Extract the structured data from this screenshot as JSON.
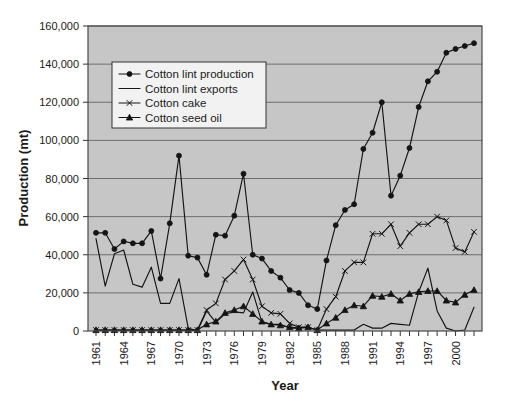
{
  "chart_data": {
    "type": "line",
    "title": "",
    "xlabel": "Year",
    "ylabel": "Production (mt)",
    "ylim": [
      0,
      160000
    ],
    "xlim": [
      1961,
      2002
    ],
    "grid": true,
    "legend_position": "upper-left-inside",
    "ytick_labels": [
      "0",
      "20,000",
      "40,000",
      "60,000",
      "80,000",
      "100,000",
      "120,000",
      "140,000",
      "160,000"
    ],
    "ytick_values": [
      0,
      20000,
      40000,
      60000,
      80000,
      100000,
      120000,
      140000,
      160000
    ],
    "xtick_labels": [
      "1961",
      "1964",
      "1967",
      "1970",
      "1973",
      "1976",
      "1979",
      "1982",
      "1985",
      "1988",
      "1991",
      "1994",
      "1997",
      "2000"
    ],
    "xtick_values": [
      1961,
      1964,
      1967,
      1970,
      1973,
      1976,
      1979,
      1982,
      1985,
      1988,
      1991,
      1994,
      1997,
      2000
    ],
    "x": [
      1961,
      1962,
      1963,
      1964,
      1965,
      1966,
      1967,
      1968,
      1969,
      1970,
      1971,
      1972,
      1973,
      1974,
      1975,
      1976,
      1977,
      1978,
      1979,
      1980,
      1981,
      1982,
      1983,
      1984,
      1985,
      1986,
      1987,
      1988,
      1989,
      1990,
      1991,
      1992,
      1993,
      1994,
      1995,
      1996,
      1997,
      1998,
      1999,
      2000,
      2001,
      2002
    ],
    "series": [
      {
        "name": "Cotton lint production",
        "marker": "filled-circle",
        "color": "#141414",
        "values": [
          51500,
          51500,
          43000,
          47000,
          46000,
          46000,
          52500,
          27500,
          56500,
          92000,
          39500,
          38500,
          29500,
          50500,
          50000,
          60500,
          82500,
          40000,
          38000,
          31500,
          28000,
          21500,
          20000,
          13500,
          11500,
          37000,
          55500,
          63500,
          66500,
          95500,
          104000,
          120000,
          71000,
          81500,
          96000,
          117500,
          131000,
          136000,
          146000,
          148000,
          149500,
          151000
        ]
      },
      {
        "name": "Cotton lint exports",
        "marker": "none",
        "color": "#141414",
        "values": [
          48500,
          23500,
          40500,
          42500,
          24500,
          23000,
          33500,
          14500,
          14500,
          27500,
          1500,
          0,
          10500,
          4500,
          9000,
          10000,
          9500,
          20500,
          4500,
          3500,
          3500,
          1500,
          1500,
          2000,
          500,
          500,
          500,
          500,
          500,
          3500,
          1500,
          1500,
          4000,
          3500,
          3000,
          20500,
          33000,
          10500,
          1500,
          0,
          500,
          12500
        ]
      },
      {
        "name": "Cotton cake",
        "marker": "x-cross",
        "color": "#141414",
        "values": [
          500,
          500,
          500,
          500,
          500,
          500,
          500,
          500,
          500,
          500,
          500,
          500,
          11000,
          14500,
          27000,
          31500,
          37500,
          27000,
          13000,
          9500,
          9000,
          4000,
          2000,
          2000,
          500,
          11500,
          18000,
          31500,
          36000,
          36000,
          51000,
          51000,
          56000,
          44500,
          51500,
          56000,
          56000,
          60000,
          58000,
          43500,
          41500,
          52000
        ]
      },
      {
        "name": "Cotton seed oil",
        "marker": "filled-triangle",
        "color": "#141414",
        "values": [
          500,
          500,
          500,
          500,
          500,
          500,
          500,
          500,
          500,
          500,
          500,
          500,
          3500,
          5000,
          9500,
          11000,
          13000,
          9000,
          5000,
          3500,
          3000,
          2000,
          1500,
          2000,
          500,
          4000,
          7000,
          11000,
          13500,
          13000,
          18500,
          18000,
          19500,
          16000,
          19500,
          20500,
          21000,
          21000,
          16000,
          15000,
          19000,
          21500
        ]
      }
    ]
  },
  "legend": {
    "items": [
      {
        "label": "Cotton lint production",
        "marker": "filled-circle"
      },
      {
        "label": "Cotton lint exports",
        "marker": "none"
      },
      {
        "label": "Cotton cake",
        "marker": "x-cross"
      },
      {
        "label": "Cotton seed oil",
        "marker": "filled-triangle"
      }
    ]
  },
  "axes": {
    "y_title": "Production (mt)",
    "x_title": "Year"
  },
  "colors": {
    "plot_background": "#c6c6c6",
    "gridline": "#6e6e6e",
    "series": "#141414",
    "page_background": "#ffffff"
  }
}
